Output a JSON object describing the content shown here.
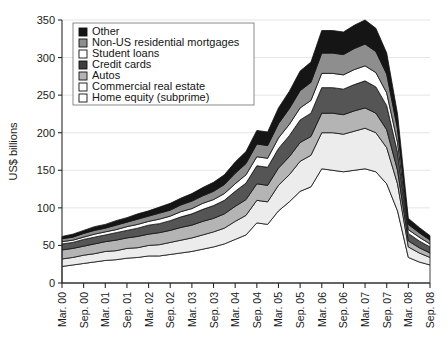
{
  "chart_data": {
    "type": "area",
    "stacked": true,
    "title": "",
    "xlabel": "",
    "ylabel": "US$ billions",
    "ylim": [
      0,
      350
    ],
    "ytick_step": 50,
    "yticks": [
      "0",
      "50",
      "100",
      "150",
      "200",
      "250",
      "300",
      "350"
    ],
    "grid": true,
    "legend_position": "top-left",
    "x": [
      "Mar. 00",
      "Jun. 00",
      "Sep. 00",
      "Dec. 00",
      "Mar. 01",
      "Jun. 01",
      "Sep. 01",
      "Dec. 01",
      "Mar. 02",
      "Jun. 02",
      "Sep. 02",
      "Dec. 02",
      "Mar. 03",
      "Jun. 03",
      "Sep. 03",
      "Dec. 03",
      "Mar. 04",
      "Jun. 04",
      "Sep. 04",
      "Dec. 04",
      "Mar. 05",
      "Jun. 05",
      "Sep. 05",
      "Dec. 05",
      "Mar. 06",
      "Jun. 06",
      "Sep. 06",
      "Dec. 06",
      "Mar. 07",
      "Jun. 07",
      "Sep. 07",
      "Dec. 07",
      "Mar. 08",
      "Jun. 08",
      "Sep. 08"
    ],
    "xticklabels": [
      "Mar. 00",
      "Sep. 00",
      "Mar. 01",
      "Sep. 01",
      "Mar. 02",
      "Sep. 02",
      "Mar. 03",
      "Sep. 03",
      "Mar. 04",
      "Sep. 04",
      "Mar. 05",
      "Sep. 05",
      "Mar. 06",
      "Sep. 06",
      "Mar. 07",
      "Sep. 07",
      "Mar. 08",
      "Sep. 08"
    ],
    "xtick_every": 2,
    "series": [
      {
        "name": "Home equity (subprime)",
        "color": "#ffffff",
        "values": [
          22,
          24,
          26,
          28,
          30,
          31,
          33,
          34,
          36,
          36,
          38,
          40,
          42,
          45,
          48,
          52,
          58,
          64,
          80,
          78,
          96,
          108,
          122,
          128,
          152,
          150,
          148,
          150,
          152,
          148,
          132,
          96,
          34,
          28,
          24
        ]
      },
      {
        "name": "Commercial real estate",
        "color": "#ececec",
        "values": [
          10,
          10,
          11,
          11,
          12,
          12,
          13,
          13,
          14,
          15,
          16,
          17,
          18,
          19,
          20,
          21,
          24,
          26,
          30,
          30,
          34,
          36,
          40,
          42,
          48,
          50,
          50,
          52,
          54,
          52,
          48,
          36,
          14,
          12,
          10
        ]
      },
      {
        "name": "Autos",
        "color": "#b4b4b4",
        "values": [
          12,
          12,
          12,
          13,
          13,
          14,
          14,
          15,
          15,
          16,
          16,
          17,
          17,
          18,
          18,
          19,
          20,
          21,
          22,
          22,
          23,
          24,
          25,
          25,
          26,
          26,
          26,
          27,
          27,
          26,
          24,
          18,
          8,
          7,
          6
        ]
      },
      {
        "name": "Credit cards",
        "color": "#555555",
        "values": [
          8,
          8,
          9,
          9,
          9,
          10,
          10,
          11,
          12,
          12,
          13,
          14,
          15,
          16,
          17,
          18,
          20,
          22,
          24,
          24,
          26,
          28,
          30,
          31,
          34,
          34,
          34,
          35,
          36,
          35,
          32,
          24,
          10,
          9,
          8
        ]
      },
      {
        "name": "Student loans",
        "color": "#ffffff",
        "values": [
          3,
          3,
          3,
          4,
          4,
          4,
          5,
          5,
          5,
          6,
          6,
          7,
          7,
          8,
          8,
          9,
          10,
          11,
          12,
          12,
          14,
          15,
          16,
          17,
          19,
          19,
          19,
          20,
          20,
          19,
          17,
          13,
          5,
          5,
          4
        ]
      },
      {
        "name": "Non-US residential mortgages",
        "color": "#8e8e8e",
        "values": [
          4,
          4,
          5,
          5,
          5,
          6,
          6,
          7,
          7,
          8,
          8,
          9,
          10,
          10,
          11,
          12,
          14,
          15,
          17,
          17,
          19,
          21,
          23,
          24,
          27,
          27,
          27,
          28,
          29,
          28,
          25,
          18,
          7,
          6,
          5
        ]
      },
      {
        "name": "Other",
        "color": "#151515",
        "values": [
          3,
          4,
          4,
          5,
          5,
          6,
          6,
          7,
          7,
          8,
          9,
          9,
          10,
          11,
          12,
          13,
          15,
          16,
          18,
          18,
          21,
          23,
          26,
          27,
          30,
          30,
          30,
          31,
          32,
          31,
          28,
          20,
          8,
          7,
          6
        ]
      }
    ]
  },
  "legend": {
    "items": [
      {
        "label": "Other",
        "color": "#151515"
      },
      {
        "label": "Non-US residential mortgages",
        "color": "#8e8e8e"
      },
      {
        "label": "Student loans",
        "color": "#ffffff"
      },
      {
        "label": "Credit cards",
        "color": "#3d3d3d"
      },
      {
        "label": "Autos",
        "color": "#b4b4b4"
      },
      {
        "label": "Commercial real estate",
        "color": "#ffffff"
      },
      {
        "label": "Home equity (subprime)",
        "color": "#ffffff"
      }
    ]
  }
}
